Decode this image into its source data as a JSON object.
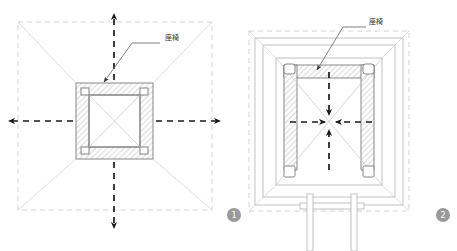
{
  "sheet": {
    "background": "#ffffff",
    "width": 457,
    "height": 251
  },
  "palette": {
    "outline": "#6b6b6b",
    "outline_light": "#b9b9b9",
    "construction_dash": "#c9c9c9",
    "motion_arrow": "#1a1a1a",
    "hatch": "#c0c0c0",
    "hatch_fill": "#fdfdfd",
    "leader": "#6b6b6b",
    "label_text": "#2b2b2b",
    "badge_fill": "#9a9a9a",
    "badge_text": "#ffffff"
  },
  "figures": [
    {
      "id": "figure-1",
      "badge": "1",
      "view": "plan",
      "annotation": {
        "text": "座椅",
        "text_x": 172,
        "text_y": 40,
        "leader_points": "160,43 132,43 104,82",
        "arrow_at": [
          104,
          82
        ]
      },
      "outer_boundary": {
        "x": 18,
        "y": 22,
        "w": 194,
        "h": 188
      },
      "frame_outer": {
        "x": 76,
        "y": 83,
        "w": 77,
        "h": 76
      },
      "frame_inner": {
        "x": 89,
        "y": 95,
        "w": 51,
        "h": 52
      },
      "corner_legs": [
        {
          "x": 81,
          "y": 88
        },
        {
          "x": 136,
          "y": 88
        },
        {
          "x": 81,
          "y": 142
        },
        {
          "x": 136,
          "y": 142
        }
      ],
      "motion_arrows": [
        {
          "dir": "up",
          "label": "motion-arrow-up"
        },
        {
          "dir": "down",
          "label": "motion-arrow-down"
        },
        {
          "dir": "left",
          "label": "motion-arrow-left"
        },
        {
          "dir": "right",
          "label": "motion-arrow-right"
        }
      ],
      "motion_direction": "outward"
    },
    {
      "id": "figure-2",
      "badge": "2",
      "view": "elevation",
      "annotation": {
        "text": "座椅",
        "text_x": 370,
        "text_y": 23,
        "leader_points": "366,27 343,27 317,70",
        "arrow_at": [
          317,
          70
        ]
      },
      "outer_boundary": {
        "x": 249,
        "y": 31,
        "w": 160,
        "h": 180
      },
      "shell_rings": [
        {
          "x": 255,
          "y": 38,
          "w": 148,
          "h": 167
        },
        {
          "x": 263,
          "y": 45,
          "w": 132,
          "h": 152
        },
        {
          "x": 276,
          "y": 58,
          "w": 106,
          "h": 127
        }
      ],
      "seat_band": {
        "x": 284,
        "y": 65,
        "w": 90,
        "h": 13
      },
      "seat_columns": [
        {
          "x": 284,
          "y": 65,
          "w": 13,
          "h": 105
        },
        {
          "x": 361,
          "y": 65,
          "w": 13,
          "h": 105
        }
      ],
      "corner_legs": [
        {
          "x": 284,
          "y": 64
        },
        {
          "x": 361,
          "y": 64
        },
        {
          "x": 284,
          "y": 163
        },
        {
          "x": 361,
          "y": 163
        }
      ],
      "base_stand": {
        "platform": {
          "x": 302,
          "y": 205,
          "w": 62,
          "h": 6
        },
        "posts": [
          {
            "x": 308,
            "y": 196,
            "w": 5,
            "h": 55
          },
          {
            "x": 351,
            "y": 196,
            "w": 5,
            "h": 55
          }
        ]
      },
      "motion_arrows": [
        {
          "dir": "down",
          "label": "motion-arrow-down"
        },
        {
          "dir": "up",
          "label": "motion-arrow-up"
        },
        {
          "dir": "right",
          "label": "motion-arrow-right"
        },
        {
          "dir": "left",
          "label": "motion-arrow-left"
        }
      ],
      "motion_direction": "inward"
    }
  ],
  "badges": [
    {
      "name": "figure-badge-1",
      "text": "1",
      "cx": 234,
      "cy": 215,
      "r": 7
    },
    {
      "name": "figure-badge-2",
      "text": "2",
      "cx": 443,
      "cy": 215,
      "r": 7
    }
  ]
}
